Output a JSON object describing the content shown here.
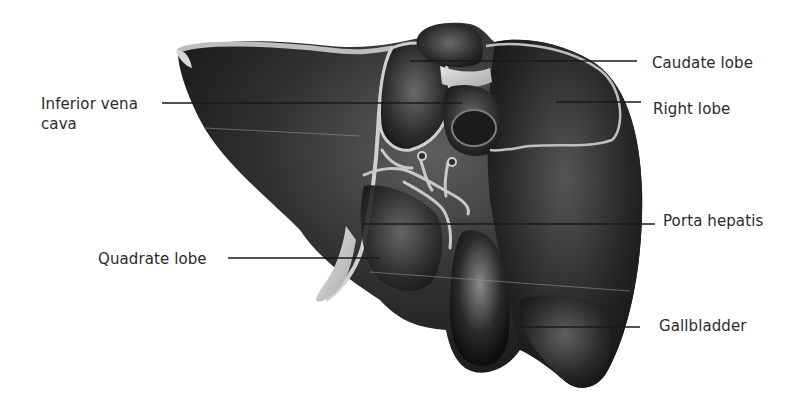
{
  "figure": {
    "colors": {
      "background": "#ffffff",
      "liver_dark": "#1c1c1c",
      "liver_mid": "#3a3a3a",
      "liver_highlight": "#6e6e6e",
      "ligament": "#cfcfcf",
      "leader_line": "#1a1a1a",
      "label_text": "#2b2b2b"
    },
    "labels": [
      {
        "id": "inferior-vena-cava",
        "text": "Inferior vena\ncava",
        "side": "left",
        "x": 41,
        "y": 94,
        "line": {
          "x1": 162,
          "y1": 103,
          "x2": 462,
          "y2": 103
        }
      },
      {
        "id": "quadrate-lobe",
        "text": "Quadrate lobe",
        "side": "left",
        "x": 98,
        "y": 249,
        "line": {
          "x1": 228,
          "y1": 258,
          "x2": 380,
          "y2": 258
        }
      },
      {
        "id": "caudate-lobe",
        "text": "Caudate lobe",
        "side": "right",
        "x": 652,
        "y": 53,
        "line": {
          "x1": 410,
          "y1": 61,
          "x2": 637,
          "y2": 61
        }
      },
      {
        "id": "right-lobe",
        "text": "Right lobe",
        "side": "right",
        "x": 653,
        "y": 99,
        "line": {
          "x1": 556,
          "y1": 102,
          "x2": 641,
          "y2": 102
        }
      },
      {
        "id": "porta-hepatis",
        "text": "Porta hepatis",
        "side": "right",
        "x": 663,
        "y": 211,
        "line": {
          "x1": 362,
          "y1": 224,
          "x2": 655,
          "y2": 224
        }
      },
      {
        "id": "gallbladder",
        "text": "Gallbladder",
        "side": "right",
        "x": 659,
        "y": 316,
        "line": {
          "x1": 520,
          "y1": 327,
          "x2": 640,
          "y2": 327
        }
      }
    ]
  }
}
